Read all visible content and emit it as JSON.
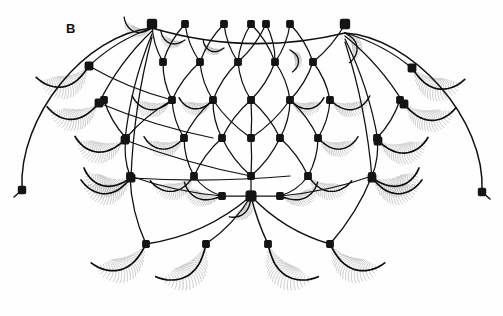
{
  "figure": {
    "panel_label": "B",
    "background_color": "#fefefe",
    "ink_color": "#101010",
    "barb_color": "#8d8d8d",
    "node_color": "#141414",
    "width": 503,
    "height": 316
  },
  "chart_data": {
    "type": "diagram",
    "title": "B",
    "symmetry": "bilateral about x = 251",
    "node_count": 45,
    "seta_count": 30,
    "grid": false,
    "legend": null,
    "xlabel": "",
    "ylabel": "",
    "xlim": [
      0,
      503
    ],
    "ylim": [
      0,
      316
    ],
    "lattice_rows": [
      {
        "row": 0,
        "label": "dorsal-arc",
        "y": 24,
        "nodes_x": [
          152,
          185,
          224,
          251,
          266,
          290,
          345
        ]
      },
      {
        "row": 1,
        "label": "row-1",
        "y": 62,
        "nodes_x": [
          163,
          200,
          238,
          275,
          313
        ]
      },
      {
        "row": 2,
        "label": "row-2",
        "y": 100,
        "nodes_x": [
          104,
          172,
          213,
          251,
          290,
          330,
          400
        ]
      },
      {
        "row": 3,
        "label": "row-3",
        "y": 138,
        "nodes_x": [
          126,
          184,
          222,
          251,
          280,
          318,
          377
        ]
      },
      {
        "row": 4,
        "label": "row-4",
        "y": 176,
        "nodes_x": [
          130,
          194,
          251,
          308,
          372
        ]
      },
      {
        "row": 5,
        "label": "row-5",
        "y": 196,
        "nodes_x": [
          222,
          251,
          280
        ]
      },
      {
        "row": 6,
        "label": "ventral-fan",
        "y": 244,
        "nodes_x": [
          146,
          206,
          268,
          330
        ]
      }
    ],
    "margin_tips": [
      {
        "side": "left",
        "x": 22,
        "y": 190
      },
      {
        "side": "right",
        "x": 482,
        "y": 192
      }
    ],
    "apexes": [
      {
        "side": "left",
        "x": 152,
        "y": 28
      },
      {
        "side": "right",
        "x": 345,
        "y": 33
      }
    ],
    "central_hub": {
      "x": 251,
      "y": 196
    }
  },
  "elements": {
    "canvas_name": "seta-network-drawing",
    "left_margin_arc": "left-outer-margin-arc",
    "right_margin_arc": "right-outer-margin-arc",
    "dorsal_arc": "dorsal-connecting-arc"
  }
}
